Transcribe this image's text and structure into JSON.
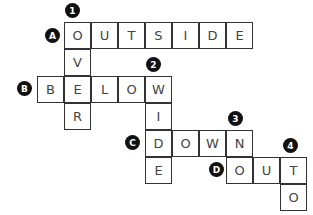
{
  "puzzle": {
    "type": "crossword",
    "cell_size": 27,
    "origin": {
      "x": 37,
      "y": 22
    },
    "colors": {
      "border": "#333333",
      "letter": "#444444",
      "badge_bg": "#111111",
      "badge_text": "#ffffff"
    },
    "across": [
      {
        "label": "A",
        "answer": "OUTSIDE",
        "row": 0,
        "col": 1
      },
      {
        "label": "B",
        "answer": "BELOW",
        "row": 2,
        "col": 0
      },
      {
        "label": "C",
        "answer": "DOWN",
        "row": 4,
        "col": 4
      },
      {
        "label": "D",
        "answer": "OUT",
        "row": 5,
        "col": 7
      }
    ],
    "down": [
      {
        "label": "1",
        "answer": "OVER",
        "row": 0,
        "col": 1
      },
      {
        "label": "2",
        "answer": "WIDE",
        "row": 2,
        "col": 4
      },
      {
        "label": "3",
        "answer": "NO",
        "row": 4,
        "col": 7
      },
      {
        "label": "4",
        "answer": "TO",
        "row": 5,
        "col": 9
      }
    ],
    "cells": [
      {
        "r": 0,
        "c": 1,
        "ch": "O"
      },
      {
        "r": 0,
        "c": 2,
        "ch": "U"
      },
      {
        "r": 0,
        "c": 3,
        "ch": "T"
      },
      {
        "r": 0,
        "c": 4,
        "ch": "S"
      },
      {
        "r": 0,
        "c": 5,
        "ch": "I"
      },
      {
        "r": 0,
        "c": 6,
        "ch": "D"
      },
      {
        "r": 0,
        "c": 7,
        "ch": "E"
      },
      {
        "r": 1,
        "c": 1,
        "ch": "V"
      },
      {
        "r": 2,
        "c": 0,
        "ch": "B"
      },
      {
        "r": 2,
        "c": 1,
        "ch": "E"
      },
      {
        "r": 2,
        "c": 2,
        "ch": "L"
      },
      {
        "r": 2,
        "c": 3,
        "ch": "O"
      },
      {
        "r": 2,
        "c": 4,
        "ch": "W"
      },
      {
        "r": 3,
        "c": 1,
        "ch": "R"
      },
      {
        "r": 3,
        "c": 4,
        "ch": "I"
      },
      {
        "r": 4,
        "c": 4,
        "ch": "D"
      },
      {
        "r": 4,
        "c": 5,
        "ch": "O"
      },
      {
        "r": 4,
        "c": 6,
        "ch": "W"
      },
      {
        "r": 4,
        "c": 7,
        "ch": "N"
      },
      {
        "r": 5,
        "c": 4,
        "ch": "E"
      },
      {
        "r": 5,
        "c": 7,
        "ch": "O"
      },
      {
        "r": 5,
        "c": 8,
        "ch": "U"
      },
      {
        "r": 5,
        "c": 9,
        "ch": "T"
      },
      {
        "r": 6,
        "c": 9,
        "ch": "O"
      }
    ],
    "badges": [
      {
        "text": "1",
        "x": 65,
        "y": 3
      },
      {
        "text": "A",
        "x": 45,
        "y": 28
      },
      {
        "text": "2",
        "x": 146,
        "y": 57
      },
      {
        "text": "B",
        "x": 17,
        "y": 81
      },
      {
        "text": "3",
        "x": 228,
        "y": 111
      },
      {
        "text": "C",
        "x": 125,
        "y": 135
      },
      {
        "text": "4",
        "x": 283,
        "y": 138
      },
      {
        "text": "D",
        "x": 209,
        "y": 162
      }
    ]
  }
}
